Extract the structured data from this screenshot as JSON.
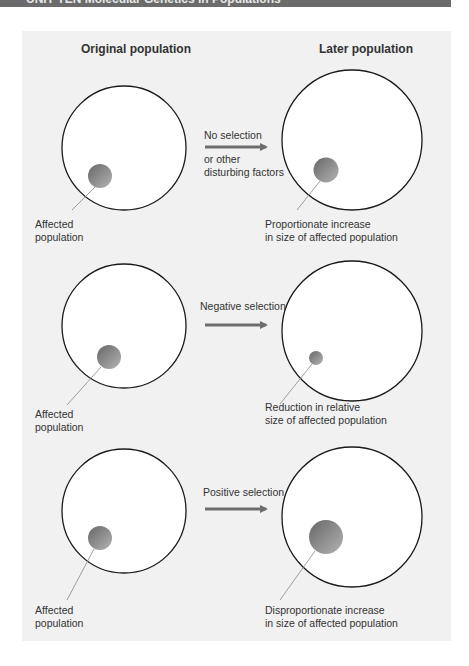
{
  "header": {
    "title": "UNIT TEN Molecular Genetics in Populations",
    "bar_color": "#6b6b6b"
  },
  "diagram": {
    "columns": {
      "left_title": "Original population",
      "right_title": "Later population"
    },
    "colors": {
      "panel_bg": "#f1f1f1",
      "circle_fill": "#ffffff",
      "circle_stroke": "#1a1a1a",
      "affected_dark": "#6a6a6a",
      "affected_light": "#b0b0b0",
      "arrow": "#6e6e6e",
      "leader_line": "#888888"
    },
    "rows": [
      {
        "scenario": "No selection",
        "arrow_label_top": "No selection",
        "arrow_label_bottom_1": "or other",
        "arrow_label_bottom_2": "disturbing factors",
        "left_label_1": "Affected",
        "left_label_2": "population",
        "right_label_1": "Proportionate increase",
        "right_label_2": "in size of affected population",
        "left_affected_radius": 12,
        "right_affected_radius": 12.5
      },
      {
        "scenario": "Negative selection",
        "arrow_label_top": "Negative selection",
        "left_label_1": "Affected",
        "left_label_2": "population",
        "right_label_1": "Reduction in relative",
        "right_label_2": "size of affected population",
        "left_affected_radius": 12,
        "right_affected_radius": 7
      },
      {
        "scenario": "Positive selection",
        "arrow_label_top": "Positive selection",
        "left_label_1": "Affected",
        "left_label_2": "population",
        "right_label_1": "Disproportionate increase",
        "right_label_2": "in size of affected population",
        "left_affected_radius": 12,
        "right_affected_radius": 17
      }
    ]
  }
}
